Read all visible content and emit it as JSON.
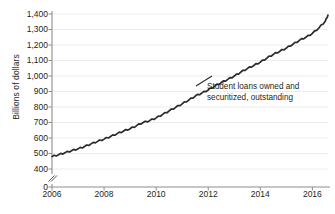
{
  "chart_data": {
    "type": "line",
    "title": "",
    "xlabel": "",
    "ylabel": "Billions of dollars",
    "xlim": [
      2006.0,
      2016.6
    ],
    "ylim": [
      400,
      1400
    ],
    "y_axis_break": true,
    "y_break_between": [
      0,
      400
    ],
    "grid": true,
    "grid_axis": "y",
    "legend": "none",
    "annotations": [
      {
        "text_line_1": "Student loans owned and",
        "text_line_2": "securitized, outstanding",
        "x": 2012.0,
        "y": 980
      }
    ],
    "xticks": [
      2006,
      2008,
      2010,
      2012,
      2014,
      2016
    ],
    "xtick_labels": [
      "2006",
      "2008",
      "2010",
      "2012",
      "2014",
      "2016"
    ],
    "yticks": [
      0,
      400,
      500,
      600,
      700,
      800,
      900,
      1000,
      1100,
      1200,
      1300,
      1400
    ],
    "ytick_labels": [
      "0",
      "400",
      "500",
      "600",
      "700",
      "800",
      "900",
      "1,000",
      "1,100",
      "1,200",
      "1,300",
      "1,400"
    ],
    "series": [
      {
        "name": "Student loans owned and securitized, outstanding",
        "color": "#2b2b2b",
        "x": [
          2006.0,
          2006.25,
          2006.5,
          2006.75,
          2007.0,
          2007.25,
          2007.5,
          2007.75,
          2008.0,
          2008.25,
          2008.5,
          2008.75,
          2009.0,
          2009.25,
          2009.5,
          2009.75,
          2010.0,
          2010.25,
          2010.5,
          2010.75,
          2011.0,
          2011.25,
          2011.5,
          2011.75,
          2012.0,
          2012.25,
          2012.5,
          2012.75,
          2013.0,
          2013.25,
          2013.5,
          2013.75,
          2014.0,
          2014.25,
          2014.5,
          2014.75,
          2015.0,
          2015.25,
          2015.5,
          2015.75,
          2016.0,
          2016.25,
          2016.5,
          2016.6
        ],
        "values": [
          481,
          492,
          505,
          518,
          530,
          545,
          562,
          578,
          593,
          610,
          628,
          645,
          660,
          680,
          700,
          712,
          730,
          752,
          775,
          798,
          820,
          845,
          870,
          890,
          910,
          935,
          958,
          978,
          1000,
          1025,
          1048,
          1068,
          1090,
          1115,
          1140,
          1160,
          1180,
          1205,
          1230,
          1250,
          1275,
          1310,
          1355,
          1393
        ]
      }
    ]
  },
  "axis": {
    "y_title": "Billions of dollars",
    "break_symbol": "//"
  }
}
